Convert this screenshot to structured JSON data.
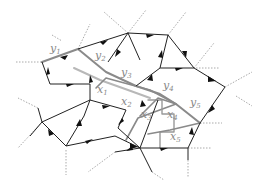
{
  "diagram": {
    "colors": {
      "black_edge": "#222222",
      "gray_path": "#8a8a8a",
      "light_gray_path": "#b8b8b8",
      "dotted": "#aaaaaa",
      "label": "#888888"
    },
    "labels": [
      {
        "id": "y1",
        "base": "y",
        "sub": "1",
        "x": 50,
        "y": 52
      },
      {
        "id": "y2",
        "base": "y",
        "sub": "2",
        "x": 95,
        "y": 59
      },
      {
        "id": "y3",
        "base": "y",
        "sub": "3",
        "x": 121,
        "y": 76
      },
      {
        "id": "y4",
        "base": "y",
        "sub": "4",
        "x": 163,
        "y": 89
      },
      {
        "id": "y5",
        "base": "y",
        "sub": "5",
        "x": 190,
        "y": 106
      },
      {
        "id": "x1",
        "base": "x",
        "sub": "1",
        "x": 97,
        "y": 93
      },
      {
        "id": "x2",
        "base": "x",
        "sub": "2",
        "x": 121,
        "y": 105
      },
      {
        "id": "x3",
        "base": "x",
        "sub": "3",
        "x": 141,
        "y": 118
      },
      {
        "id": "x4",
        "base": "x",
        "sub": "4",
        "x": 167,
        "y": 118
      },
      {
        "id": "x5",
        "base": "x",
        "sub": "5",
        "x": 170,
        "y": 140
      }
    ]
  }
}
